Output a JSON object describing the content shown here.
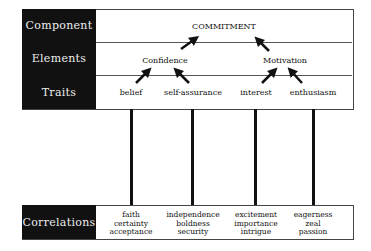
{
  "rows": {
    "component": {
      "label": "Component",
      "items": [
        "COMMITMENT"
      ]
    },
    "elements": {
      "label": "Elements",
      "items": [
        "Confidence",
        "Motivation"
      ]
    },
    "traits": {
      "label": "Traits",
      "items": [
        "belief",
        "self-assurance",
        "interest",
        "enthusiasm"
      ]
    },
    "correlations": {
      "label": "Correlations",
      "items": [
        {
          "lines": [
            "faith",
            "certainty",
            "acceptance"
          ]
        },
        {
          "lines": [
            "independence",
            "boldness",
            "security"
          ]
        },
        {
          "lines": [
            "excitement",
            "importance",
            "intrigue"
          ]
        },
        {
          "lines": [
            "eagerness",
            "zeal",
            "passion"
          ]
        }
      ]
    }
  }
}
